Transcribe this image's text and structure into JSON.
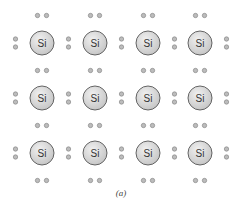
{
  "figure": {
    "caption": "(a)",
    "element_label": "Si",
    "rows": 3,
    "cols": 4,
    "col_x": [
      42,
      95,
      148,
      200
    ],
    "row_y": [
      43,
      98,
      153
    ],
    "atom_radius": 12,
    "electron_dot_radius": 2.2,
    "colors": {
      "atom_fill_light": "#f0f0f0",
      "atom_fill_dark": "#c4c4c4",
      "atom_stroke": "#555555",
      "label": "#333333",
      "electron_fill": "#bcbcbc",
      "electron_stroke": "#7a7a7a"
    }
  }
}
